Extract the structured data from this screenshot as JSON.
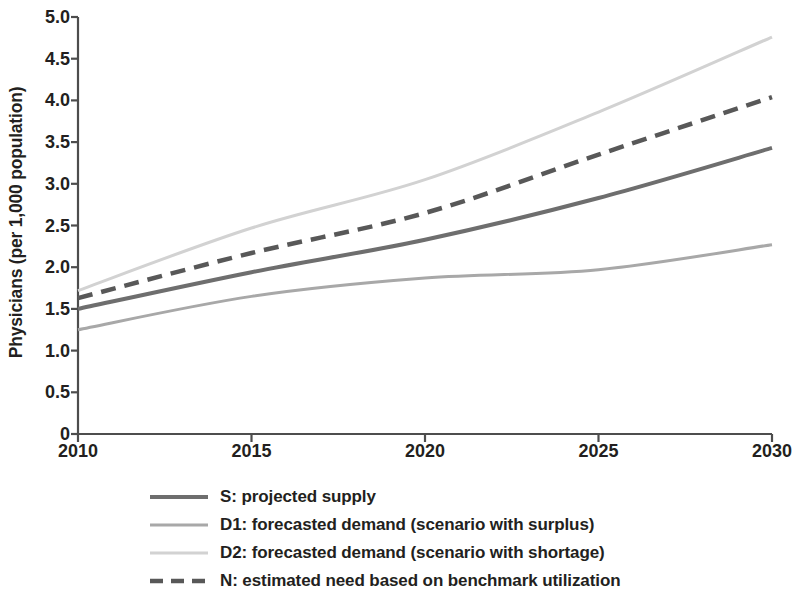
{
  "chart_data": {
    "type": "line",
    "title": "",
    "xlabel": "",
    "ylabel": "Physicians (per 1,000 population)",
    "xlim": [
      2010,
      2030
    ],
    "ylim": [
      0,
      5.0
    ],
    "grid": false,
    "legend_position": "below",
    "x_ticks": [
      "2010",
      "2015",
      "2020",
      "2025",
      "2030"
    ],
    "y_ticks": [
      "0",
      "0.5",
      "1.0",
      "1.5",
      "2.0",
      "2.5",
      "3.0",
      "3.5",
      "4.0",
      "4.5",
      "5.0"
    ],
    "x": [
      2010,
      2015,
      2020,
      2025,
      2030
    ],
    "series": [
      {
        "name": "S: projected supply",
        "key": "S",
        "style": "solid",
        "color": "#6e6e6e",
        "width": 4,
        "values": [
          1.5,
          1.94,
          2.33,
          2.83,
          3.43
        ]
      },
      {
        "name": "D1: forecasted demand (scenario with surplus)",
        "key": "D1",
        "style": "solid",
        "color": "#a8a8a8",
        "width": 3,
        "values": [
          1.25,
          1.65,
          1.87,
          1.97,
          2.27
        ]
      },
      {
        "name": "D2: forecasted demand (scenario with shortage)",
        "key": "D2",
        "style": "solid",
        "color": "#d2d2d2",
        "width": 3,
        "values": [
          1.72,
          2.47,
          3.05,
          3.86,
          4.76
        ]
      },
      {
        "name": "N: estimated need based on benchmark utilization",
        "key": "N",
        "style": "dashed",
        "color": "#585858",
        "width": 4.5,
        "values": [
          1.63,
          2.17,
          2.65,
          3.35,
          4.04
        ]
      }
    ]
  },
  "legend": {
    "items": [
      {
        "label": "S: projected supply",
        "style": "solid",
        "color": "#6e6e6e",
        "width": 4
      },
      {
        "label": "D1: forecasted demand (scenario with surplus)",
        "style": "solid",
        "color": "#a8a8a8",
        "width": 3
      },
      {
        "label": "D2: forecasted demand (scenario with shortage)",
        "style": "solid",
        "color": "#d2d2d2",
        "width": 3
      },
      {
        "label": "N: estimated need based on benchmark utilization",
        "style": "dashed",
        "color": "#585858",
        "width": 4.5
      }
    ]
  },
  "axes": {
    "axis_color": "#4d4d4d",
    "y_axis_title": "Physicians (per 1,000 population)"
  }
}
